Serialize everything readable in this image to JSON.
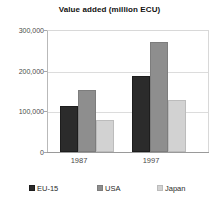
{
  "chart_data": {
    "type": "bar",
    "title": "Value added (million ECU)",
    "xlabel": "",
    "ylabel": "",
    "categories": [
      "1987",
      "1997"
    ],
    "series": [
      {
        "name": "EU-15",
        "values": [
          115000,
          188000
        ],
        "color": "#2b2b2b"
      },
      {
        "name": "USA",
        "values": [
          154000,
          272000
        ],
        "color": "#8e8e8e"
      },
      {
        "name": "Japan",
        "values": [
          80000,
          130000
        ],
        "color": "#d2d2d2"
      }
    ],
    "ylim": [
      0,
      300000
    ],
    "y_ticks": [
      0,
      100000,
      200000,
      300000
    ],
    "y_tick_labels": [
      "0",
      "100,000",
      "200,000",
      "300,000"
    ],
    "grid": true,
    "legend_position": "bottom"
  },
  "axes": {
    "y_tick_labels": [
      "300,000",
      "200,000",
      "100,000",
      "0"
    ],
    "x_tick_labels": [
      "1987",
      "1997"
    ]
  },
  "legend": {
    "items": [
      {
        "label": "EU-15",
        "swatch": "legend-swatch-dark"
      },
      {
        "label": "USA",
        "swatch": "legend-swatch-medium-gray"
      },
      {
        "label": "Japan",
        "swatch": "legend-swatch-light-gray"
      }
    ]
  }
}
